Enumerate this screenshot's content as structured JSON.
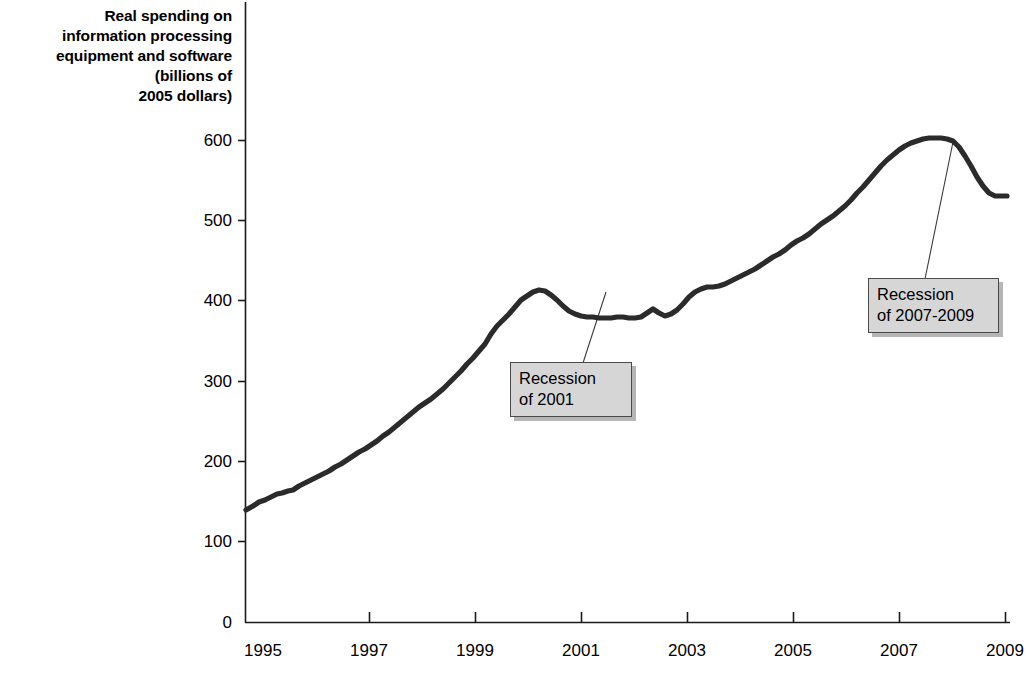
{
  "chart_data": {
    "type": "line",
    "title": "",
    "ylabel": "Real spending on information processing equipment and software (billions of 2005 dollars)",
    "xlabel": "",
    "xlim": [
      1994.75,
      2010.0
    ],
    "ylim": [
      0,
      640
    ],
    "grid": false,
    "legend": null,
    "ytick_labels": [
      "600",
      "500",
      "400",
      "300",
      "200",
      "100",
      "0"
    ],
    "ytick_values": [
      600,
      500,
      400,
      300,
      200,
      100,
      0
    ],
    "xtick_labels": [
      "1995",
      "1997",
      "1999",
      "2001",
      "2003",
      "2005",
      "2007",
      "2009"
    ],
    "xtick_values": [
      1995,
      1997,
      1999,
      2001,
      2003,
      2005,
      2007,
      2009
    ],
    "series": [
      {
        "name": "Real spending on information processing equipment and software",
        "color": "#2b2b2b",
        "x": [
          1995.0,
          1995.25,
          1995.5,
          1995.75,
          1996.0,
          1996.25,
          1996.5,
          1996.75,
          1997.0,
          1997.25,
          1997.5,
          1997.75,
          1998.0,
          1998.25,
          1998.5,
          1998.75,
          1999.0,
          1999.25,
          1999.5,
          1999.75,
          2000.0,
          2000.25,
          2000.5,
          2000.75,
          2001.0,
          2001.25,
          2001.5,
          2001.75,
          2002.0,
          2002.25,
          2002.5,
          2002.75,
          2003.0,
          2003.25,
          2003.5,
          2003.75,
          2004.0,
          2004.25,
          2004.5,
          2004.75,
          2005.0,
          2005.25,
          2005.5,
          2005.75,
          2006.0,
          2006.25,
          2006.5,
          2006.75,
          2007.0,
          2007.25,
          2007.5,
          2007.75,
          2008.0,
          2008.25,
          2008.5,
          2008.75,
          2009.0,
          2009.25,
          2009.5,
          2009.75
        ],
        "y": [
          140,
          146,
          152,
          157,
          160,
          164,
          170,
          177,
          184,
          191,
          198,
          205,
          212,
          220,
          229,
          239,
          250,
          262,
          275,
          290,
          307,
          330,
          345,
          360,
          378,
          395,
          408,
          410,
          404,
          392,
          382,
          377,
          375,
          375,
          374,
          376,
          374,
          380,
          390,
          398,
          414,
          427,
          429,
          429,
          432,
          440,
          447,
          455,
          462,
          470,
          472,
          478,
          490,
          497,
          500,
          512,
          520,
          530,
          545,
          558
        ]
      }
    ],
    "annotations": [
      {
        "id": "recession-2001",
        "text": "Recession\nof 2001",
        "box_x": 510,
        "box_y": 362,
        "box_w": 122,
        "box_h": 55,
        "leader_from_x": 583,
        "leader_from_y": 362,
        "leader_to_x": 606,
        "leader_to_y": 291
      },
      {
        "id": "recession-2007-2009",
        "text": "Recession\nof 2007-2009",
        "box_x": 868,
        "box_y": 278,
        "box_w": 131,
        "box_h": 55,
        "leader_from_x": 925,
        "leader_from_y": 278,
        "leader_to_x": 953,
        "leader_to_y": 141
      }
    ],
    "curve_pixel_path": "M 246,510 L 253,506 L 259,502 L 265,500 L 271,497 L 277,494 L 282,493 L 288,491 L 293,490 L 299,486 L 305,483 L 311,480 L 317,477 L 323,474 L 329,471 L 335,467 L 341,464 L 347,460 L 353,456 L 359,452 L 365,449 L 371,445 L 377,441 L 383,436 L 389,432 L 395,427 L 401,422 L 407,417 L 413,412 L 419,407 L 425,403 L 431,399 L 437,394 L 443,389 L 449,383 L 455,377 L 461,371 L 467,364 L 473,358 L 479,351 L 485,344 L 491,334 L 497,326 L 503,320 L 509,314 L 515,307 L 521,300 L 527,296 L 533,292 L 539,290 L 545,291 L 551,295 L 557,300 L 563,306 L 569,311 L 575,314 L 581,316 L 587,317 L 593,317 L 599,318 L 605,318 L 611,318 L 617,317 L 623,317 L 629,318 L 635,318 L 641,317 L 647,313 L 653,309 L 659,313 L 665,316 L 671,314 L 677,310 L 683,304 L 689,297 L 695,292 L 701,289 L 707,287 L 713,287 L 719,286 L 725,284 L 731,281 L 737,278 L 743,275 L 749,272 L 755,269 L 761,265 L 767,261 L 773,257 L 779,254 L 785,250 L 791,245 L 797,241 L 803,238 L 809,234 L 815,229 L 821,224 L 827,220 L 833,216 L 839,211 L 845,206 L 851,200 L 857,193 L 863,187 L 869,180 L 875,173 L 881,166 L 887,160 L 893,155 L 899,150 L 905,146 L 911,143 L 917,141 L 923,139 L 929,138 L 935,138 L 941,138 L 947,139 L 953,141 L 959,147 L 965,156 L 971,166 L 977,177 L 983,186 L 989,193 L 995,196 L 1001,196 L 1007,196"
  },
  "axes": {
    "y_axis_title_text": "Real spending on\ninformation processing\nequipment and software\n(billions of\n2005 dollars)",
    "axis_color": "#1a1a1a",
    "line_color": "#2b2b2b",
    "callout_fill": "#d6d6d6",
    "callout_border": "#4a4a4a"
  },
  "ytick_positions": [
    {
      "label": "600",
      "y": 140
    },
    {
      "label": "500",
      "y": 220
    },
    {
      "label": "400",
      "y": 300
    },
    {
      "label": "300",
      "y": 381
    },
    {
      "label": "200",
      "y": 461
    },
    {
      "label": "100",
      "y": 541
    },
    {
      "label": "0",
      "y": 622
    }
  ],
  "xtick_positions": [
    {
      "label": "1995",
      "x": 263
    },
    {
      "label": "1997",
      "x": 369
    },
    {
      "label": "1999",
      "x": 475
    },
    {
      "label": "2001",
      "x": 581
    },
    {
      "label": "2003",
      "x": 687
    },
    {
      "label": "2005",
      "x": 793
    },
    {
      "label": "2007",
      "x": 899
    },
    {
      "label": "2009",
      "x": 1005
    }
  ],
  "annotations": {
    "recession_2001": "Recession\nof 2001",
    "recession_2007": "Recession\nof 2007-2009"
  },
  "source_note": ""
}
